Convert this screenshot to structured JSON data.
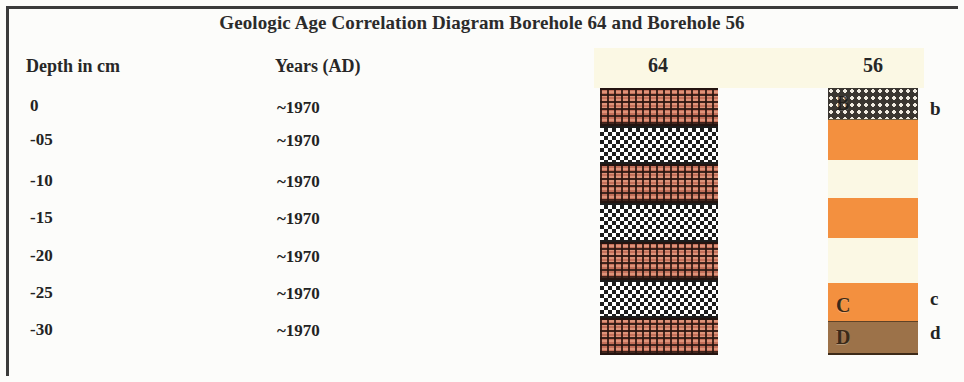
{
  "title": "Geologic Age Correlation Diagram Borehole 64 and Borehole 56",
  "headers": {
    "depth": "Depth in cm",
    "years": "Years (AD)",
    "core_left": "64",
    "core_right": "56"
  },
  "rows": [
    {
      "depth": "0",
      "year": "~1970"
    },
    {
      "depth": "-05",
      "year": "~1970"
    },
    {
      "depth": "-10",
      "year": "~1970"
    },
    {
      "depth": "-15",
      "year": "~1970"
    },
    {
      "depth": "-20",
      "year": "~1970"
    },
    {
      "depth": "-25",
      "year": "~1970"
    },
    {
      "depth": "-30",
      "year": "~1970"
    }
  ],
  "chart_data": {
    "type": "table",
    "title": "Geologic Age Correlation Diagram Borehole 64 and Borehole 56",
    "xlabel": "",
    "ylabel": "Depth in cm",
    "ylim": [
      -30,
      0
    ],
    "axis_ticks": [
      "0",
      "-05",
      "-10",
      "-15",
      "-20",
      "-25",
      "-30"
    ],
    "age_column": {
      "label": "Years (AD)",
      "values": [
        "~1970",
        "~1970",
        "~1970",
        "~1970",
        "~1970",
        "~1970",
        "~1970"
      ]
    },
    "columns": [
      {
        "name": "64",
        "x_px": 600,
        "width_px": 118,
        "bands": [
          {
            "lithology": "plaid",
            "color": "#c4705a",
            "height_px": 38,
            "letter": ""
          },
          {
            "lithology": "checker",
            "color": "#ffffff",
            "height_px": 38,
            "letter": ""
          },
          {
            "lithology": "plaid",
            "color": "#c4705a",
            "height_px": 39,
            "letter": ""
          },
          {
            "lithology": "checker",
            "color": "#ffffff",
            "height_px": 39,
            "letter": ""
          },
          {
            "lithology": "plaid",
            "color": "#c4705a",
            "height_px": 38,
            "letter": ""
          },
          {
            "lithology": "checker",
            "color": "#ffffff",
            "height_px": 38,
            "letter": ""
          },
          {
            "lithology": "plaid",
            "color": "#c4705a",
            "height_px": 37,
            "letter": ""
          }
        ]
      },
      {
        "name": "56",
        "x_px": 828,
        "width_px": 90,
        "bands": [
          {
            "lithology": "dotted-dark",
            "color": "#3a3631",
            "height_px": 32,
            "letter": "B"
          },
          {
            "lithology": "orange",
            "color": "#f3903f",
            "height_px": 40,
            "letter": ""
          },
          {
            "lithology": "gap",
            "color": "#fbf8e4",
            "height_px": 38,
            "letter": ""
          },
          {
            "lithology": "orange",
            "color": "#f3903f",
            "height_px": 40,
            "letter": ""
          },
          {
            "lithology": "gap",
            "color": "#fbf8e4",
            "height_px": 45,
            "letter": ""
          },
          {
            "lithology": "orange",
            "color": "#f3903f",
            "height_px": 38,
            "letter": "C"
          },
          {
            "lithology": "brown",
            "color": "#9c7249",
            "height_px": 34,
            "letter": "D"
          }
        ]
      }
    ],
    "unit_labels": [
      {
        "text": "b",
        "y_px": 98
      },
      {
        "text": "c",
        "y_px": 288
      },
      {
        "text": "d",
        "y_px": 322
      }
    ],
    "legend": "none",
    "grid": false
  },
  "colors": {
    "background": "#fcfcfa",
    "header_strip": "#fbf8e4",
    "lithology_plaid": "#c4705a",
    "lithology_checker": "#ffffff",
    "lithology_dotted": "#3a3631",
    "lithology_orange": "#f3903f",
    "lithology_brown": "#9c7249",
    "text": "#262626",
    "border": "#3b3b3b"
  }
}
